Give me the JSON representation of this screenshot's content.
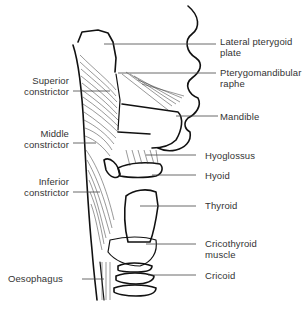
{
  "figure": {
    "type": "anatomical line drawing",
    "background_color": "#ffffff",
    "ink_color": "#111111",
    "label_color": "#333333"
  },
  "labels_right": [
    {
      "id": "lateral-pterygoid-plate",
      "lines": [
        "Lateral pterygoid",
        "plate"
      ]
    },
    {
      "id": "pterygomandibular-raphe",
      "lines": [
        "Pterygomandibular",
        "raphe"
      ]
    },
    {
      "id": "mandible",
      "lines": [
        "Mandible"
      ]
    },
    {
      "id": "hyoglossus",
      "lines": [
        "Hyoglossus"
      ]
    },
    {
      "id": "hyoid",
      "lines": [
        "Hyoid"
      ]
    },
    {
      "id": "thyroid",
      "lines": [
        "Thyroid"
      ]
    },
    {
      "id": "cricothyroid-muscle",
      "lines": [
        "Cricothyroid",
        "muscle"
      ]
    },
    {
      "id": "cricoid",
      "lines": [
        "Cricoid"
      ]
    }
  ],
  "labels_left": [
    {
      "id": "superior-constrictor",
      "lines": [
        "Superior",
        "constrictor"
      ]
    },
    {
      "id": "middle-constrictor",
      "lines": [
        "Middle",
        "constrictor"
      ]
    },
    {
      "id": "inferior-constrictor",
      "lines": [
        "Inferior",
        "constrictor"
      ]
    },
    {
      "id": "oesophagus",
      "lines": [
        "Oesophagus"
      ]
    }
  ]
}
